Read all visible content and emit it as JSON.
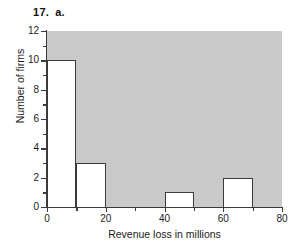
{
  "figure": {
    "number": "17.",
    "part": "a."
  },
  "chart_data": {
    "type": "bar",
    "title": "",
    "xlabel": "Revenue loss in millions",
    "ylabel": "Number of firms",
    "bin_width": 10,
    "bin_edges": [
      0,
      10,
      20,
      30,
      40,
      50,
      60,
      70,
      80
    ],
    "categories": [
      "0-10",
      "10-20",
      "20-30",
      "30-40",
      "40-50",
      "50-60",
      "60-70",
      "70-80"
    ],
    "values": [
      10,
      3,
      0,
      0,
      1,
      0,
      2,
      0
    ],
    "xlim": [
      0,
      80
    ],
    "ylim": [
      0,
      12
    ],
    "xticks": [
      0,
      20,
      40,
      60,
      80
    ],
    "xtick_labels": [
      "0",
      "20",
      "40",
      "60",
      "80"
    ],
    "xminor_ticks": [
      10,
      30,
      50,
      70
    ],
    "yticks": [
      0,
      2,
      4,
      6,
      8,
      10,
      12
    ],
    "ytick_labels": [
      "0",
      "2",
      "4",
      "6",
      "8",
      "10",
      "12"
    ],
    "yminor_ticks": [
      1,
      3,
      5,
      7,
      9,
      11
    ],
    "grid": false,
    "legend": null,
    "plot_background_color": "#c9c9c9",
    "bar_fill_color": "#ffffff",
    "bar_edge_color": "#3a3a3a"
  }
}
